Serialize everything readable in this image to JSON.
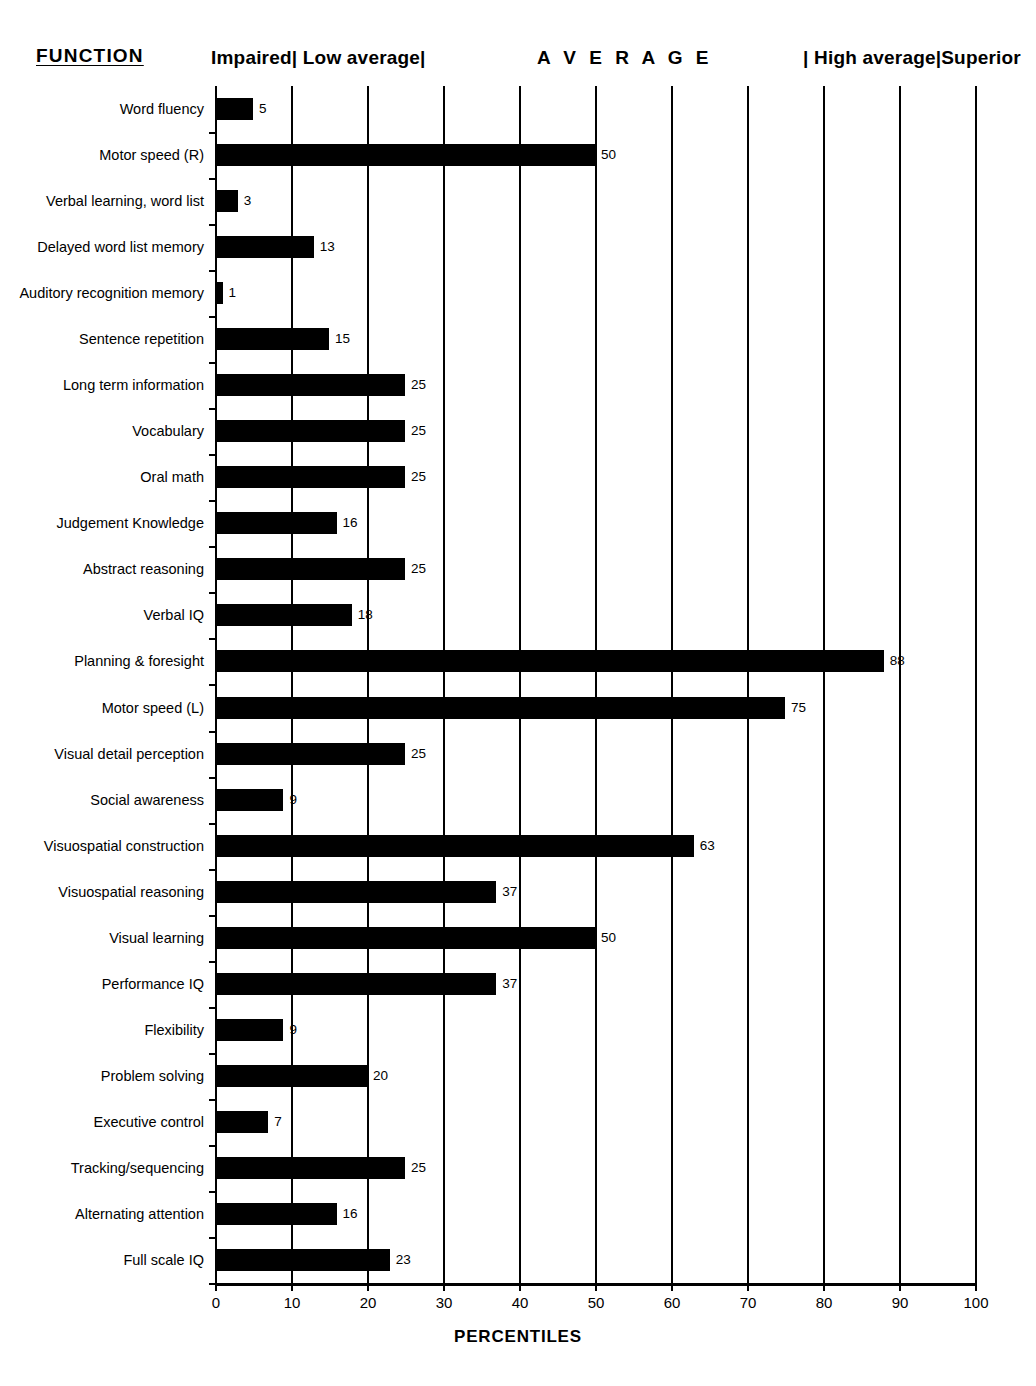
{
  "header": {
    "function_label": "FUNCTION",
    "band_impaired": "Impaired| Low average|",
    "band_average": "A V E R A G E",
    "band_high": "| High average|Superior"
  },
  "axis": {
    "title": "PERCENTILES",
    "ticks": [
      "0",
      "10",
      "20",
      "30",
      "40",
      "50",
      "60",
      "70",
      "80",
      "90",
      "100"
    ]
  },
  "chart_data": {
    "type": "bar",
    "orientation": "horizontal",
    "title": "",
    "xlabel": "PERCENTILES",
    "ylabel": "FUNCTION",
    "xlim": [
      0,
      100
    ],
    "xticks": [
      0,
      10,
      20,
      30,
      40,
      50,
      60,
      70,
      80,
      90,
      100
    ],
    "grid": "vertical gridlines at every 10 percentile",
    "legend": "none",
    "bar_color": "#000000",
    "annotations": [
      "Impaired| Low average|",
      "A V E R A G E",
      "| High average|Superior"
    ],
    "categories": [
      "Word fluency",
      "Motor speed (R)",
      "Verbal learning, word list",
      "Delayed word list memory",
      "Auditory recognition memory",
      "Sentence repetition",
      "Long term information",
      "Vocabulary",
      "Oral math",
      "Judgement Knowledge",
      "Abstract reasoning",
      "Verbal IQ",
      "Planning & foresight",
      "Motor speed (L)",
      "Visual detail perception",
      "Social awareness",
      "Visuospatial construction",
      "Visuospatial reasoning",
      "Visual learning",
      "Performance IQ",
      "Flexibility",
      "Problem solving",
      "Executive control",
      "Tracking/sequencing",
      "Alternating attention",
      "Full scale IQ"
    ],
    "values": [
      5,
      50,
      3,
      13,
      1,
      15,
      25,
      25,
      25,
      16,
      25,
      18,
      88,
      75,
      25,
      9,
      63,
      37,
      50,
      37,
      9,
      20,
      7,
      25,
      16,
      23
    ],
    "value_labels": [
      "5",
      "50",
      "3",
      "13",
      "1",
      "15",
      "25",
      "25",
      "25",
      "16",
      "25",
      "18",
      "88",
      "75",
      "25",
      "9",
      "63",
      "37",
      "50",
      "37",
      "9",
      "20",
      "7",
      "25",
      "16",
      "23"
    ]
  }
}
